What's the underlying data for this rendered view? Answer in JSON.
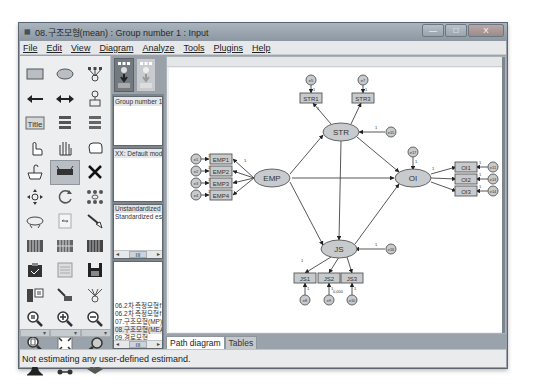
{
  "window": {
    "title": "08.구조모형(mean) : Group number 1 : Input",
    "controls": {
      "minimize": "—",
      "maximize": "□",
      "close": "X"
    }
  },
  "menu": [
    "File",
    "Edit",
    "View",
    "Diagram",
    "Analyze",
    "Tools",
    "Plugins",
    "Help"
  ],
  "toolbox": {
    "tools": [
      "draw-observed-variable",
      "draw-unobserved-variable",
      "draw-indicator-variable",
      "draw-path",
      "draw-covariance",
      "add-unique-variable",
      "figure-caption",
      "list-model-variables",
      "list-dataset-variables",
      "select-one-object",
      "select-all-objects",
      "deselect-all-objects",
      "duplicate-objects",
      "move-objects",
      "erase-objects",
      "change-shape",
      "rotate-indicators",
      "reflect-indicators",
      "move-parameter",
      "scroll",
      "touch-up",
      "select-data-files",
      "analysis-properties",
      "calculate-estimates",
      "copy-to-clipboard",
      "view-text",
      "save-diagram",
      "object-properties",
      "drag-properties",
      "preserve-symmetries",
      "zoom-selected",
      "zoom-in",
      "zoom-out",
      "view-page",
      "fit-to-page",
      "loupe",
      "bayesian-estimation",
      "multiple-group-analysis",
      "print"
    ],
    "selected_index": 13,
    "title_tool_label": "Title"
  },
  "panels": {
    "groups": {
      "items": [
        "Group number 1"
      ]
    },
    "models": {
      "items": [
        "XX: Default model"
      ]
    },
    "parameter_formats": {
      "items": [
        "Unstandardized estin",
        "Standardized estimat"
      ]
    },
    "files": {
      "items": [
        "06.2차 측정모형f",
        "06.2차 측정모형f",
        "07.구조모형(MP)",
        "08.구조모형(MEA",
        "09.경로모형"
      ],
      "selected_index": 3
    },
    "scroll_label": "III"
  },
  "tabs": {
    "path_diagram": "Path diagram",
    "tables": "Tables"
  },
  "status": "Not estimating any user-defined estimand.",
  "diagram": {
    "latent": [
      {
        "id": "EMP",
        "label": "EMP",
        "x": 103,
        "y": 110
      },
      {
        "id": "STR",
        "label": "STR",
        "x": 172,
        "y": 64
      },
      {
        "id": "JS",
        "label": "JS",
        "x": 170,
        "y": 181
      },
      {
        "id": "OI",
        "label": "OI",
        "x": 244,
        "y": 110
      }
    ],
    "observed": [
      {
        "label": "EMP1",
        "x": 52,
        "y": 91
      },
      {
        "label": "EMP2",
        "x": 52,
        "y": 103
      },
      {
        "label": "EMP3",
        "x": 52,
        "y": 115
      },
      {
        "label": "EMP4",
        "x": 52,
        "y": 127
      },
      {
        "label": "STR1",
        "x": 142,
        "y": 30
      },
      {
        "label": "STR3",
        "x": 194,
        "y": 30
      },
      {
        "label": "OI1",
        "x": 297,
        "y": 99
      },
      {
        "label": "OI2",
        "x": 297,
        "y": 111
      },
      {
        "label": "OI3",
        "x": 297,
        "y": 123
      },
      {
        "label": "JS1",
        "x": 136,
        "y": 210
      },
      {
        "label": "JS2",
        "x": 160,
        "y": 210
      },
      {
        "label": "JS3",
        "x": 183,
        "y": 210
      }
    ],
    "errors": [
      {
        "label": "e1",
        "x": 27,
        "y": 91
      },
      {
        "label": "e2",
        "x": 27,
        "y": 103
      },
      {
        "label": "e3",
        "x": 27,
        "y": 115
      },
      {
        "label": "e4",
        "x": 27,
        "y": 127
      },
      {
        "label": "e5",
        "x": 142,
        "y": 12
      },
      {
        "label": "e7",
        "x": 194,
        "y": 12
      },
      {
        "label": "e15",
        "x": 222,
        "y": 64
      },
      {
        "label": "e17",
        "x": 244,
        "y": 84
      },
      {
        "label": "e16",
        "x": 222,
        "y": 181
      },
      {
        "label": "e11",
        "x": 324,
        "y": 99
      },
      {
        "label": "e13",
        "x": 324,
        "y": 111
      },
      {
        "label": "e14",
        "x": 324,
        "y": 123
      },
      {
        "label": "e8",
        "x": 136,
        "y": 232
      },
      {
        "label": "e9",
        "x": 160,
        "y": 232
      },
      {
        "label": "e10",
        "x": 183,
        "y": 232
      }
    ],
    "fixed_label": "1",
    "annotation": "0,000"
  }
}
